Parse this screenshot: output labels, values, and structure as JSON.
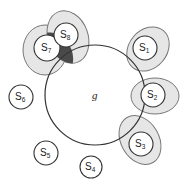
{
  "diagram": {
    "type": "set-coverage",
    "main_set": {
      "label": "g",
      "cx": 95,
      "cy": 95,
      "r": 50
    },
    "subsets": [
      {
        "id": "s1",
        "base": "S",
        "sub": "1",
        "cx": 145,
        "cy": 48,
        "r": 12,
        "halo": {
          "cx": 148,
          "cy": 49,
          "rx": 19,
          "ry": 24,
          "rot": 40
        }
      },
      {
        "id": "s2",
        "base": "S",
        "sub": "2",
        "cx": 153,
        "cy": 95,
        "r": 12,
        "halo": {
          "cx": 155,
          "cy": 96,
          "rx": 24,
          "ry": 18,
          "rot": 0
        }
      },
      {
        "id": "s3",
        "base": "S",
        "sub": "3",
        "cx": 141,
        "cy": 144,
        "r": 12,
        "halo": {
          "cx": 140,
          "cy": 140,
          "rx": 19,
          "ry": 26,
          "rot": -30
        }
      },
      {
        "id": "s4",
        "base": "S",
        "sub": "4",
        "cx": 91,
        "cy": 167,
        "r": 11,
        "halo": null
      },
      {
        "id": "s5",
        "base": "S",
        "sub": "5",
        "cx": 46,
        "cy": 153,
        "r": 12,
        "halo": null
      },
      {
        "id": "s6",
        "base": "S",
        "sub": "6",
        "cx": 21,
        "cy": 97,
        "r": 12,
        "halo": null
      },
      {
        "id": "s7",
        "base": "S",
        "sub": "7",
        "cx": 47,
        "cy": 48,
        "r": 13,
        "halo": {
          "cx": 45,
          "cy": 50,
          "rx": 22,
          "ry": 25,
          "rot": 0
        }
      },
      {
        "id": "s8",
        "base": "S",
        "sub": "8",
        "cx": 66,
        "cy": 35,
        "r": 12,
        "halo": {
          "cx": 68,
          "cy": 37,
          "rx": 20,
          "ry": 27,
          "rot": -20
        }
      }
    ],
    "colors": {
      "stroke": "#333333",
      "halo_fill": "#e6e6e6",
      "halo_stroke": "#777777",
      "overlap_fill": "#444444",
      "background": "#ffffff"
    }
  }
}
